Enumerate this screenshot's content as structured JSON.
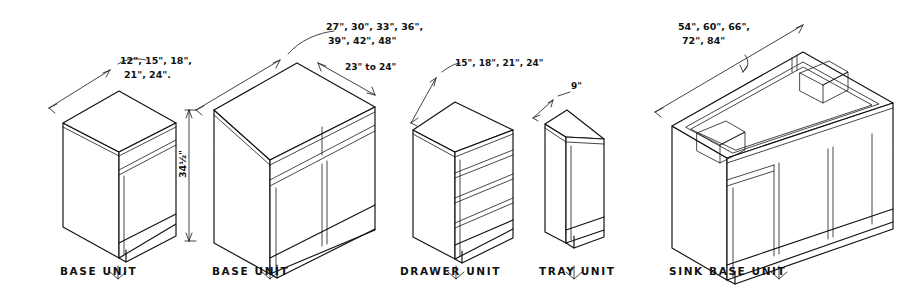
{
  "drawing": {
    "title": "Kitchen Cabinet Base Unit Types - Isometric Dimension Reference",
    "background_color": "#ffffff",
    "line_color": "#111111",
    "common_height": "34½\"",
    "units": [
      {
        "id": "base-unit-small",
        "caption": "BASE UNIT",
        "width_options": "12\", 15\", 18\",",
        "width_options_line2": "21\", 24\".",
        "height_label": "34½\"",
        "doors": 1,
        "drawers": 1
      },
      {
        "id": "base-unit-wide",
        "caption": "BASE UNIT",
        "width_options": "27\", 30\", 33\", 36\",",
        "width_options_line2": "39\", 42\", 48\"",
        "depth_label": "23\" to 24\"",
        "doors": 2,
        "drawers": 2
      },
      {
        "id": "drawer-unit",
        "caption": "DRAWER UNIT",
        "width_options": "15\", 18\", 21\", 24\"",
        "drawers": 4
      },
      {
        "id": "tray-unit",
        "caption": "TRAY UNIT",
        "width_options": "9\"",
        "doors": 1
      },
      {
        "id": "sink-base-unit",
        "caption": "SINK BASE UNIT",
        "width_options": "54\", 60\", 66\",",
        "width_options_line2": "72\", 84\"",
        "doors": 3,
        "drawers": 1,
        "open_top": true
      }
    ]
  }
}
